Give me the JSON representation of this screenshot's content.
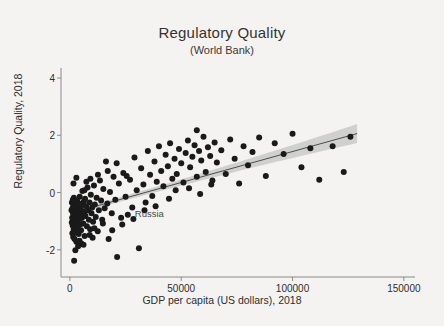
{
  "chart_data": {
    "type": "scatter",
    "title": "Regulatory Quality",
    "subtitle": "(World Bank)",
    "xlabel": "GDP per capita (US dollars), 2018",
    "ylabel": "Regulatory Quality, 2018",
    "xlim": [
      -4000,
      155000
    ],
    "ylim": [
      -2.95,
      4.35
    ],
    "xticks": [
      0,
      50000,
      100000,
      150000
    ],
    "xtick_labels": [
      "0",
      "50000",
      "100000",
      "150000"
    ],
    "yticks": [
      -2,
      0,
      2,
      4
    ],
    "ytick_labels": [
      "-2",
      "0",
      "2",
      "4"
    ],
    "grid": false,
    "legend": null,
    "marker_color": "#1a1a1a",
    "marker_size": 3.0,
    "background_color": "#f4f3f1",
    "axis_color": "#8a8a8a",
    "fit_line": {
      "color": "#4d4d4d",
      "x_start": 500,
      "y_start": -0.72,
      "x_end": 129000,
      "y_end": 2.06
    },
    "confidence_band": {
      "color": "#c9c9c9",
      "opacity": 0.85,
      "x_start": 500,
      "x_end": 129000,
      "half_width_start": 0.07,
      "half_width_end": 0.33
    },
    "annotations": [
      {
        "label": "Russia",
        "x": 26000,
        "y": -0.78
      }
    ],
    "points": [
      [
        720,
        -0.62
      ],
      [
        840,
        -1.05
      ],
      [
        900,
        -0.35
      ],
      [
        1020,
        -0.88
      ],
      [
        1100,
        -1.42
      ],
      [
        1180,
        -0.55
      ],
      [
        1250,
        -1.15
      ],
      [
        1320,
        -0.25
      ],
      [
        1400,
        -0.72
      ],
      [
        1480,
        -1.55
      ],
      [
        1550,
        -0.45
      ],
      [
        1620,
        -0.95
      ],
      [
        1700,
        -1.28
      ],
      [
        1790,
        -0.18
      ],
      [
        1860,
        -0.68
      ],
      [
        1940,
        -1.08
      ],
      [
        2010,
        -0.52
      ],
      [
        2100,
        -1.62
      ],
      [
        2180,
        -0.82
      ],
      [
        2260,
        -0.32
      ],
      [
        2340,
        -1.18
      ],
      [
        2420,
        -0.62
      ],
      [
        2500,
        -0.95
      ],
      [
        2600,
        -1.38
      ],
      [
        2700,
        -0.42
      ],
      [
        2800,
        -0.75
      ],
      [
        2900,
        -1.72
      ],
      [
        3000,
        -0.55
      ],
      [
        3100,
        -1.05
      ],
      [
        3200,
        -0.28
      ],
      [
        3350,
        -0.85
      ],
      [
        3500,
        -1.25
      ],
      [
        3650,
        -0.48
      ],
      [
        3800,
        -0.68
      ],
      [
        3950,
        -1.45
      ],
      [
        4100,
        -0.38
      ],
      [
        4250,
        -0.92
      ],
      [
        4400,
        -0.15
      ],
      [
        4550,
        -1.12
      ],
      [
        4700,
        -0.58
      ],
      [
        4850,
        -0.78
      ],
      [
        5000,
        -1.32
      ],
      [
        5200,
        -0.45
      ],
      [
        5400,
        -0.88
      ],
      [
        5600,
        0.05
      ],
      [
        5800,
        -0.65
      ],
      [
        6000,
        -1.08
      ],
      [
        6200,
        -0.32
      ],
      [
        6400,
        -0.72
      ],
      [
        6600,
        -1.52
      ],
      [
        6800,
        -0.22
      ],
      [
        7000,
        -0.82
      ],
      [
        7300,
        -0.48
      ],
      [
        7600,
        -1.18
      ],
      [
        7900,
        0.18
      ],
      [
        8200,
        -0.62
      ],
      [
        8500,
        -0.95
      ],
      [
        8800,
        -0.35
      ],
      [
        9100,
        -1.28
      ],
      [
        9400,
        -0.08
      ],
      [
        9700,
        -0.72
      ],
      [
        10000,
        -0.52
      ],
      [
        10400,
        -1.02
      ],
      [
        10800,
        0.25
      ],
      [
        11200,
        -0.42
      ],
      [
        11600,
        -0.85
      ],
      [
        12000,
        -0.18
      ],
      [
        12500,
        -1.35
      ],
      [
        13000,
        -0.62
      ],
      [
        13500,
        0.42
      ],
      [
        14000,
        -0.28
      ],
      [
        14500,
        -0.95
      ],
      [
        15000,
        0.12
      ],
      [
        15600,
        -0.55
      ],
      [
        16200,
        1.08
      ],
      [
        16800,
        -0.38
      ],
      [
        17400,
        -1.62
      ],
      [
        18000,
        0.02
      ],
      [
        18800,
        -0.72
      ],
      [
        19600,
        0.55
      ],
      [
        20400,
        -0.25
      ],
      [
        21200,
        -2.25
      ],
      [
        22000,
        0.32
      ],
      [
        23000,
        -0.88
      ],
      [
        24000,
        0.68
      ],
      [
        25000,
        -0.15
      ],
      [
        26000,
        -0.78
      ],
      [
        27000,
        0.45
      ],
      [
        28000,
        -0.52
      ],
      [
        29000,
        1.22
      ],
      [
        30000,
        0.08
      ],
      [
        31000,
        -1.95
      ],
      [
        32000,
        0.85
      ],
      [
        33000,
        0.28
      ],
      [
        34000,
        -0.35
      ],
      [
        35000,
        1.45
      ],
      [
        36000,
        0.62
      ],
      [
        37000,
        -0.12
      ],
      [
        38000,
        1.08
      ],
      [
        39000,
        0.38
      ],
      [
        40000,
        1.62
      ],
      [
        41000,
        0.75
      ],
      [
        42000,
        0.22
      ],
      [
        43000,
        1.32
      ],
      [
        44000,
        0.92
      ],
      [
        45000,
        1.72
      ],
      [
        46000,
        0.48
      ],
      [
        47000,
        1.18
      ],
      [
        48000,
        0.65
      ],
      [
        49000,
        1.52
      ],
      [
        50000,
        1.02
      ],
      [
        51000,
        0.35
      ],
      [
        52000,
        1.38
      ],
      [
        53000,
        1.82
      ],
      [
        54000,
        0.88
      ],
      [
        55000,
        1.25
      ],
      [
        56000,
        1.65
      ],
      [
        57000,
        0.55
      ],
      [
        58000,
        1.45
      ],
      [
        59000,
        1.12
      ],
      [
        60000,
        1.95
      ],
      [
        61000,
        0.72
      ],
      [
        62000,
        1.58
      ],
      [
        63000,
        1.28
      ],
      [
        64000,
        0.42
      ],
      [
        65000,
        1.75
      ],
      [
        66000,
        1.05
      ],
      [
        68000,
        1.48
      ],
      [
        70000,
        0.65
      ],
      [
        72000,
        1.85
      ],
      [
        74000,
        1.18
      ],
      [
        76000,
        0.32
      ],
      [
        78000,
        1.62
      ],
      [
        80000,
        0.95
      ],
      [
        82000,
        1.42
      ],
      [
        85000,
        1.92
      ],
      [
        88000,
        0.58
      ],
      [
        92000,
        1.72
      ],
      [
        96000,
        1.35
      ],
      [
        100000,
        2.05
      ],
      [
        104000,
        0.88
      ],
      [
        108000,
        1.55
      ],
      [
        112000,
        0.45
      ],
      [
        118000,
        1.62
      ],
      [
        123000,
        0.72
      ],
      [
        126000,
        1.95
      ],
      [
        12600,
        0.62
      ],
      [
        9200,
        0.48
      ],
      [
        7400,
        0.38
      ],
      [
        5100,
        -1.78
      ],
      [
        3700,
        -1.88
      ],
      [
        2450,
        -2.02
      ],
      [
        1900,
        -2.38
      ],
      [
        4300,
        -1.68
      ],
      [
        6100,
        -1.82
      ],
      [
        8900,
        -1.48
      ],
      [
        11000,
        -1.25
      ],
      [
        14800,
        -1.08
      ],
      [
        19000,
        -1.32
      ],
      [
        23500,
        -1.12
      ],
      [
        17000,
        0.75
      ],
      [
        21000,
        1.02
      ],
      [
        25500,
        0.58
      ],
      [
        28500,
        -0.92
      ],
      [
        33500,
        -0.62
      ],
      [
        38500,
        -0.48
      ],
      [
        44500,
        -0.22
      ],
      [
        47500,
        0.08
      ],
      [
        53500,
        0.15
      ],
      [
        58500,
        -0.05
      ],
      [
        63500,
        0.28
      ],
      [
        57000,
        2.18
      ],
      [
        1600,
        0.32
      ],
      [
        2900,
        0.52
      ],
      [
        6500,
        0.08
      ],
      [
        10200,
        -1.58
      ]
    ]
  }
}
